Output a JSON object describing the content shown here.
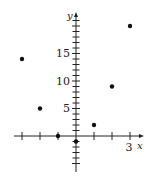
{
  "chart_data": {
    "type": "scatter",
    "title": "",
    "xlabel": "x",
    "ylabel": "y",
    "x_tick_labels": [
      {
        "value": 3,
        "label": "3"
      }
    ],
    "y_tick_labels": [
      {
        "value": 5,
        "label": "5"
      },
      {
        "value": 10,
        "label": "10"
      },
      {
        "value": 15,
        "label": "15"
      }
    ],
    "xlim": [
      -3.5,
      3.7
    ],
    "ylim": [
      -6,
      22
    ],
    "x_ticks": [
      -3,
      -2,
      -1,
      1,
      2,
      3
    ],
    "y_tick_step": 1,
    "grid": false,
    "series": [
      {
        "name": "points",
        "x": [
          -3,
          -2,
          -1,
          0,
          1,
          2,
          3
        ],
        "y": [
          14,
          5,
          0,
          -1,
          2,
          9,
          20
        ]
      }
    ],
    "colors": {
      "axis": "#222222",
      "point": "#111111"
    }
  }
}
